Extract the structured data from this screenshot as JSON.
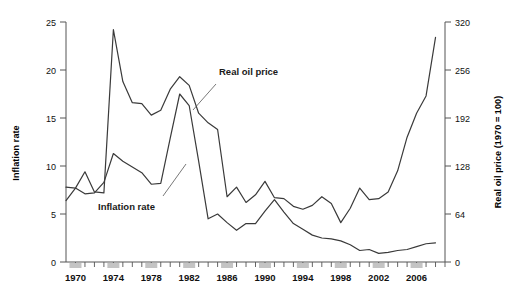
{
  "chart_data": {
    "type": "line",
    "title": "",
    "xlabel": "",
    "ylabel": "Inflation rate",
    "ylabel_right": "Real oil price (1970 = 100)",
    "xlim": [
      1969,
      2009
    ],
    "ylim": [
      0,
      25
    ],
    "ylim_right": [
      0,
      320
    ],
    "grid": false,
    "legend_position": "inline-annotation",
    "x_tick_labels": [
      "1970",
      "1974",
      "1978",
      "1982",
      "1986",
      "1990",
      "1994",
      "1998",
      "2002",
      "2006"
    ],
    "x_tick_values": [
      1970,
      1974,
      1978,
      1982,
      1986,
      1990,
      1994,
      1998,
      2002,
      2006
    ],
    "y_tick_labels_left": [
      "0",
      "5",
      "10",
      "15",
      "20",
      "25"
    ],
    "y_tick_values_left": [
      0,
      5,
      10,
      15,
      20,
      25
    ],
    "y_tick_labels_right": [
      "0",
      "64",
      "128",
      "192",
      "256",
      "320"
    ],
    "y_tick_values_right": [
      0,
      64,
      128,
      192,
      256,
      320
    ],
    "x": [
      1969,
      1970,
      1971,
      1972,
      1973,
      1974,
      1975,
      1976,
      1977,
      1978,
      1979,
      1980,
      1981,
      1982,
      1983,
      1984,
      1985,
      1986,
      1987,
      1988,
      1989,
      1990,
      1991,
      1992,
      1993,
      1994,
      1995,
      1996,
      1997,
      1998,
      1999,
      2000,
      2001,
      2002,
      2003,
      2004,
      2005,
      2006,
      2007,
      2008
    ],
    "series": [
      {
        "name": "Real oil price",
        "axis": "right",
        "annotation": "Real oil price",
        "values_right": [
          82,
          98,
          121,
          94,
          92,
          310,
          240,
          213,
          211,
          196,
          202,
          230,
          247,
          235,
          199,
          186,
          177,
          87,
          100,
          79,
          89,
          107,
          86,
          84,
          74,
          70,
          75,
          87,
          78,
          52,
          72,
          98,
          83,
          84,
          94,
          122,
          166,
          198,
          221,
          300
        ],
        "values_left_scale": [
          6.4,
          7.7,
          9.4,
          7.3,
          7.2,
          24.2,
          18.8,
          16.6,
          16.5,
          15.3,
          15.8,
          18.0,
          19.3,
          18.4,
          15.5,
          14.5,
          13.8,
          6.8,
          7.8,
          6.2,
          7.0,
          8.4,
          6.7,
          6.6,
          5.8,
          5.5,
          5.9,
          6.8,
          6.1,
          4.1,
          5.6,
          7.7,
          6.5,
          6.6,
          7.3,
          9.5,
          13.0,
          15.5,
          17.3,
          23.4
        ]
      },
      {
        "name": "Inflation rate",
        "axis": "left",
        "annotation": "Inflation rate",
        "values_left": [
          7.8,
          7.7,
          7.1,
          7.2,
          8.3,
          11.3,
          10.5,
          9.9,
          9.3,
          8.1,
          8.2,
          12.9,
          17.5,
          16.3,
          10.5,
          4.5,
          5.0,
          4.1,
          3.3,
          4.0,
          4.0,
          5.3,
          6.5,
          5.2,
          4.0,
          3.4,
          2.8,
          2.5,
          2.4,
          2.2,
          1.8,
          1.2,
          1.3,
          0.9,
          1.0,
          1.2,
          1.3,
          1.6,
          1.9,
          2.0,
          2.0,
          2.2,
          2.7,
          3.4
        ]
      }
    ],
    "series_colors": {
      "real_oil_price": "#3a3a3a",
      "inflation_rate": "#3a3a3a"
    },
    "annotations": [
      {
        "text": "Real oil price",
        "x": 1985,
        "y_left": 16.8
      },
      {
        "text": "Inflation rate",
        "x": 1975,
        "y_left": 6.3
      }
    ]
  },
  "axes": {
    "left_title": "Inflation rate",
    "right_title": "Real oil price (1970 = 100)"
  },
  "labels": {
    "annotation_real_oil_price": "Real oil price",
    "annotation_inflation_rate": "Inflation rate"
  }
}
